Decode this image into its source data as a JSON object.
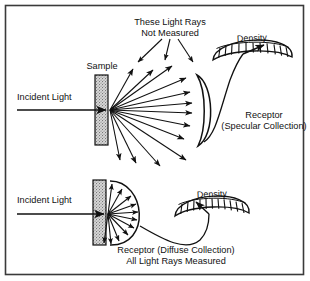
{
  "figure": {
    "border_color": "#3a3a3a",
    "background_color": "#ffffff",
    "ink_color": "#111111",
    "sample_fill_color": "#cfcfcf"
  },
  "panels": [
    {
      "id": "specular",
      "labels": {
        "callout_line1": "These Light Rays",
        "callout_line2": "Not Measured",
        "sample": "Sample",
        "incident": "Incident Light",
        "receptor_line1": "Receptor",
        "receptor_line2": "(Specular Collection)",
        "meter": "Density"
      },
      "meter": {
        "tick_count": 11,
        "needle_position": "high-right"
      },
      "rays": {
        "collected_count": 6,
        "escaping_count": 7,
        "callout_arrow_count": 3
      }
    },
    {
      "id": "diffuse",
      "labels": {
        "incident": "Incident Light",
        "receptor_line1": "Receptor (Diffuse Collection)",
        "receptor_line2": "All Light Rays Measured",
        "meter": "Density"
      },
      "meter": {
        "tick_count": 11,
        "needle_position": "mid-left"
      },
      "rays": {
        "collected_count": 11,
        "escaping_count": 0
      }
    }
  ]
}
